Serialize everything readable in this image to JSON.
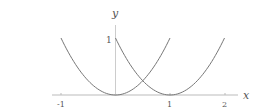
{
  "chart_data": {
    "type": "line",
    "title": "",
    "xlabel": "x",
    "ylabel": "y",
    "xlim": [
      -1.2,
      2.3
    ],
    "ylim": [
      0,
      1.25
    ],
    "x_ticks": [
      "-1",
      "1",
      "2"
    ],
    "y_ticks": [
      "1"
    ],
    "grid": false,
    "legend": null,
    "series": [
      {
        "name": "y = x^2",
        "x": [
          -1,
          -0.5,
          0,
          0.5,
          1
        ],
        "y": [
          1,
          0.25,
          0,
          0.25,
          1
        ]
      },
      {
        "name": "y = (x-1)^2",
        "x": [
          0,
          0.5,
          1,
          1.5,
          2
        ],
        "y": [
          1,
          0.25,
          0,
          0.25,
          1
        ]
      }
    ],
    "annotations": []
  },
  "axes": {
    "x_label": "x",
    "y_label": "y",
    "x_tick_neg1": "-1",
    "x_tick_1": "1",
    "x_tick_2": "2",
    "y_tick_1": "1"
  },
  "colors": {
    "curve": "#777777",
    "axis": "#bbbbbb",
    "text": "#555555"
  }
}
